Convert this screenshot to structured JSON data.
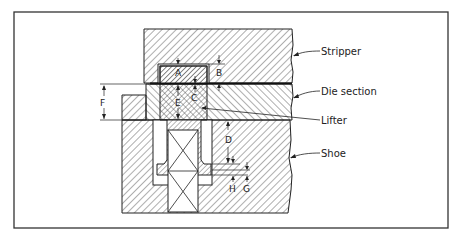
{
  "figure": {
    "frame_color": "#333333",
    "line_color": "#222222",
    "background": "#ffffff"
  },
  "labels": {
    "stripper": "Stripper",
    "die_section": "Die section",
    "lifter": "Lifter",
    "shoe": "Shoe"
  },
  "dimensions": {
    "A": "A",
    "B": "B",
    "C": "C",
    "D": "D",
    "E": "E",
    "F": "F",
    "G": "G",
    "H": "H"
  }
}
